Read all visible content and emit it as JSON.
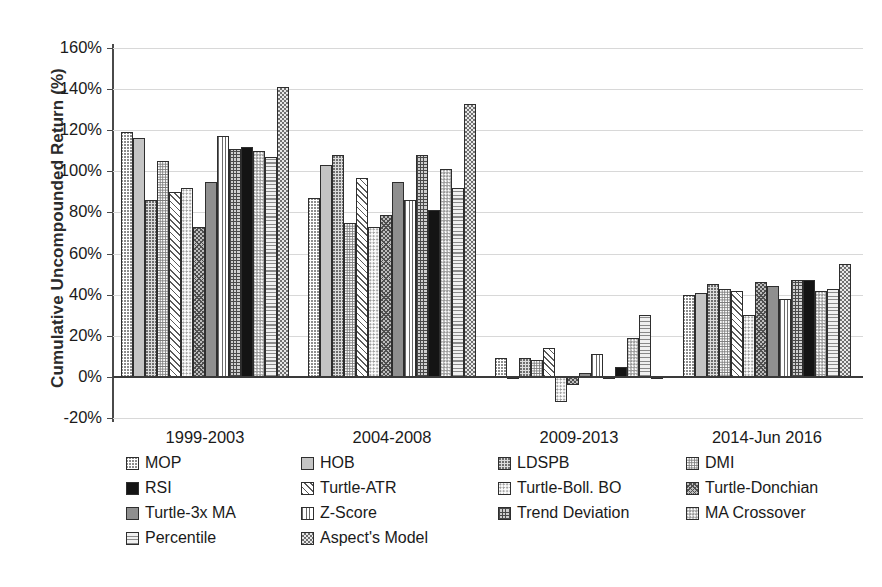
{
  "chart_data": {
    "type": "bar",
    "title": "",
    "xlabel": "",
    "ylabel": "Cumulative Uncompounded Return (%)",
    "ylim": [
      -20,
      160
    ],
    "ytick_labels": [
      "160%",
      "140%",
      "120%",
      "100%",
      "80%",
      "60%",
      "40%",
      "20%",
      "0%",
      "-20%"
    ],
    "ytick_values": [
      160,
      140,
      120,
      100,
      80,
      60,
      40,
      20,
      0,
      -20
    ],
    "grid": true,
    "legend_position": "bottom",
    "categories": [
      "1999-2003",
      "2004-2008",
      "2009-2013",
      "2014-Jun 2016"
    ],
    "series": [
      {
        "name": "MOP",
        "values": [
          119,
          87,
          9,
          40
        ]
      },
      {
        "name": "HOB",
        "values": [
          116,
          103,
          -1,
          41
        ]
      },
      {
        "name": "LDSPB",
        "values": [
          86,
          108,
          9,
          45
        ]
      },
      {
        "name": "DMI",
        "values": [
          105,
          75,
          8,
          43
        ]
      },
      {
        "name": "Turtle-ATR",
        "values": [
          90,
          97,
          14,
          42
        ]
      },
      {
        "name": "Turtle-Boll. BO",
        "values": [
          92,
          73,
          -12,
          30
        ]
      },
      {
        "name": "Turtle-Donchian",
        "values": [
          73,
          79,
          -4,
          46
        ]
      },
      {
        "name": "Turtle-3x MA",
        "values": [
          95,
          95,
          2,
          44
        ]
      },
      {
        "name": "Z-Score",
        "values": [
          117,
          86,
          11,
          38
        ]
      },
      {
        "name": "Trend Deviation",
        "values": [
          111,
          108,
          -1,
          47
        ]
      },
      {
        "name": "RSI",
        "values": [
          112,
          81,
          5,
          47
        ]
      },
      {
        "name": "MA Crossover",
        "values": [
          110,
          101,
          19,
          42
        ]
      },
      {
        "name": "Percentile",
        "values": [
          107,
          92,
          30,
          43
        ]
      },
      {
        "name": "Aspect's Model",
        "values": [
          141,
          133,
          0,
          55
        ]
      }
    ]
  },
  "legend": {
    "rows": [
      [
        {
          "label": "MOP",
          "pattern": "checker-dark-dots"
        },
        {
          "label": "HOB",
          "pattern": "solid-light-gray"
        },
        {
          "label": "LDSPB",
          "pattern": "fine-light-dots"
        },
        {
          "label": "DMI",
          "pattern": "dense-dark-grid-dots"
        }
      ],
      [
        {
          "label": "RSI",
          "pattern": "diagonal-stripes"
        },
        {
          "label": "Turtle-ATR",
          "pattern": "white-faint-dots"
        },
        {
          "label": "Turtle-Boll. BO",
          "pattern": "zigzag-crosshatch"
        },
        {
          "label": "Turtle-Donchian",
          "pattern": "solid-mid-gray"
        }
      ],
      [
        {
          "label": "Turtle-3x MA",
          "pattern": "vertical-lines"
        },
        {
          "label": "Z-Score",
          "pattern": "grid-crosshatch"
        },
        {
          "label": "Trend Deviation",
          "pattern": "solid-black"
        },
        {
          "label": "MA Crossover",
          "pattern": "medium-checker"
        }
      ],
      [
        {
          "label": "Percentile",
          "pattern": "horizontal-lines"
        },
        {
          "label": "Aspect's Model",
          "pattern": "bold-checkerboard"
        }
      ]
    ]
  },
  "colors": {
    "axis": "#4a4a4a",
    "gridline": "#d8d8d8",
    "zero_line": "#3a3a3a",
    "text": "#1a1a1a",
    "bar_outline": "#2e2e2e"
  }
}
